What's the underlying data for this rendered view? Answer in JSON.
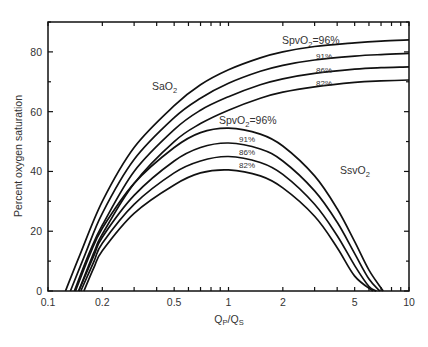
{
  "chart_data": {
    "type": "line",
    "title": "",
    "xlabel": "Qp/Qs",
    "xlabel_main": "Q",
    "xlabel_sub1": "P",
    "xlabel_mid": "/Q",
    "xlabel_sub2": "S",
    "ylabel": "Percent oxygen saturation",
    "xscale": "log",
    "xlim": [
      0.1,
      10
    ],
    "ylim": [
      0,
      90
    ],
    "grid": false,
    "x_ticks": [
      {
        "v": 0.1,
        "label": "0.1"
      },
      {
        "v": 0.2,
        "label": "0.2"
      },
      {
        "v": 0.5,
        "label": "0.5"
      },
      {
        "v": 1,
        "label": "1"
      },
      {
        "v": 2,
        "label": "2"
      },
      {
        "v": 5,
        "label": "5"
      },
      {
        "v": 10,
        "label": "10"
      }
    ],
    "y_ticks": [
      {
        "v": 0,
        "label": "0"
      },
      {
        "v": 20,
        "label": "20"
      },
      {
        "v": 40,
        "label": "40"
      },
      {
        "v": 60,
        "label": "60"
      },
      {
        "v": 80,
        "label": "80"
      }
    ],
    "annotations": {
      "sao2": {
        "main": "SaO",
        "sub": "2"
      },
      "ssvo2": {
        "main": "SsvO",
        "sub": "2"
      },
      "spvo2_top": {
        "main": "SpvO",
        "sub": "2",
        "rest": "=96%"
      },
      "spvo2_mid": {
        "main": "SpvO",
        "sub": "2",
        "rest": "=96%"
      },
      "sa_pct": [
        "91%",
        "86%",
        "82%"
      ],
      "ssv_pct": [
        "91%",
        "86%",
        "82%"
      ]
    },
    "series": [
      {
        "name": "SaO2, SpvO2=96%",
        "group": "SaO2",
        "x": [
          0.125,
          0.15,
          0.2,
          0.3,
          0.5,
          0.7,
          1,
          1.5,
          2,
          3,
          5,
          7,
          10
        ],
        "y": [
          0,
          12,
          30,
          48,
          62,
          69,
          74,
          78,
          80,
          81.8,
          83,
          83.6,
          84
        ]
      },
      {
        "name": "SaO2, SpvO2=91%",
        "group": "SaO2",
        "x": [
          0.133,
          0.16,
          0.2,
          0.3,
          0.5,
          0.7,
          1,
          1.5,
          2,
          3,
          5,
          7,
          10
        ],
        "y": [
          0,
          12,
          26,
          44,
          58,
          64.5,
          69.5,
          73.5,
          75.5,
          77.3,
          78.6,
          79.1,
          79.5
        ]
      },
      {
        "name": "SaO2, SpvO2=86%",
        "group": "SaO2",
        "x": [
          0.14,
          0.17,
          0.2,
          0.3,
          0.5,
          0.7,
          1,
          1.5,
          2,
          3,
          5,
          7,
          10
        ],
        "y": [
          0,
          13,
          22,
          40,
          54,
          60.5,
          65,
          69,
          71,
          72.8,
          74.2,
          74.7,
          75
        ]
      },
      {
        "name": "SaO2, SpvO2=82%",
        "group": "SaO2",
        "x": [
          0.148,
          0.18,
          0.2,
          0.3,
          0.5,
          0.7,
          1,
          1.5,
          2,
          3,
          5,
          7,
          10
        ],
        "y": [
          0,
          13,
          19,
          36,
          50,
          56,
          60.5,
          64.5,
          66.5,
          68.3,
          69.8,
          70.3,
          70.6
        ]
      },
      {
        "name": "SsvO2, SpvO2=96%",
        "group": "SsvO2",
        "x": [
          0.142,
          0.17,
          0.2,
          0.3,
          0.5,
          0.7,
          1,
          1.5,
          2,
          3,
          4,
          5,
          6,
          7.2
        ],
        "y": [
          0,
          12,
          21,
          36,
          48,
          53,
          54.5,
          52.5,
          48.5,
          38.5,
          27.5,
          16.5,
          7,
          0
        ]
      },
      {
        "name": "SsvO2, SpvO2=91%",
        "group": "SsvO2",
        "x": [
          0.148,
          0.18,
          0.2,
          0.3,
          0.5,
          0.7,
          1,
          1.5,
          2,
          3,
          4,
          5,
          6,
          6.9
        ],
        "y": [
          0,
          12,
          18,
          32,
          43.5,
          48,
          49.5,
          47.5,
          43.5,
          33.5,
          23,
          12.5,
          4,
          0
        ]
      },
      {
        "name": "SsvO2, SpvO2=86%",
        "group": "SsvO2",
        "x": [
          0.152,
          0.18,
          0.2,
          0.3,
          0.5,
          0.7,
          1,
          1.5,
          2,
          3,
          4,
          5,
          6,
          6.6
        ],
        "y": [
          0,
          10,
          16,
          29,
          39.5,
          43.5,
          45,
          43,
          39,
          29,
          18.5,
          8.5,
          1.5,
          0
        ]
      },
      {
        "name": "SsvO2, SpvO2=82%",
        "group": "SsvO2",
        "x": [
          0.158,
          0.18,
          0.2,
          0.3,
          0.5,
          0.7,
          1,
          1.5,
          2,
          3,
          4,
          5,
          6.3
        ],
        "y": [
          0,
          8,
          13.5,
          26,
          35.5,
          39.5,
          40.5,
          38.5,
          34.5,
          25,
          14.5,
          5,
          0
        ]
      }
    ]
  }
}
